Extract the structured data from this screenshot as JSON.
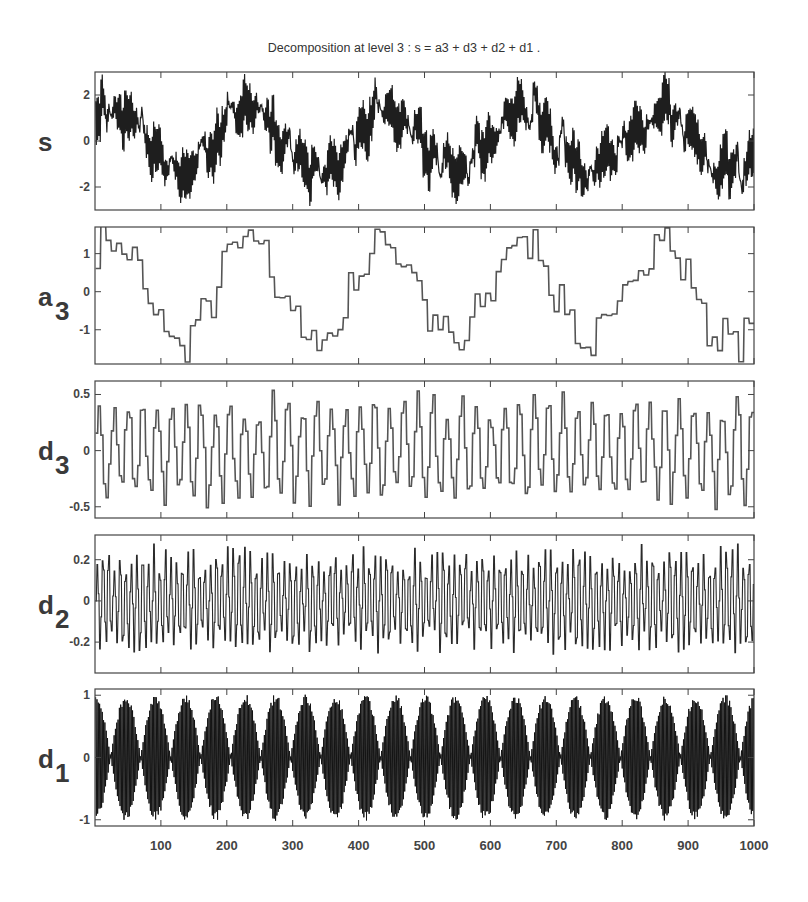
{
  "chart_data": {
    "type": "line",
    "title": "Decomposition at level 3 : s = a3 + d3 + d2 + d1 .",
    "xlabel": "",
    "xlim": [
      0,
      1000
    ],
    "x_ticks": [
      100,
      200,
      300,
      400,
      500,
      600,
      700,
      800,
      900,
      1000
    ],
    "x_tick_labels": [
      "100",
      "200",
      "300",
      "400",
      "500",
      "600",
      "700",
      "800",
      "900",
      "1000"
    ],
    "grid": false,
    "legend": null,
    "panels": [
      {
        "name": "s",
        "ylabel": "s",
        "ylabel_sub": "",
        "ylim": [
          -3,
          3
        ],
        "y_ticks": [
          -2,
          0,
          2
        ],
        "y_tick_labels": [
          "-2",
          "0",
          "2"
        ],
        "description": "Original signal: sum of a slow sinusoid (~period 210, amplitude ~1.3) plus faster oscillations; range approx -2.8 to 2.8",
        "box": {
          "top": 72,
          "bottom": 210
        }
      },
      {
        "name": "a3",
        "ylabel": "a",
        "ylabel_sub": "3",
        "ylim": [
          -1.9,
          1.7
        ],
        "y_ticks": [
          -1,
          0,
          1
        ],
        "y_tick_labels": [
          "-1",
          "0",
          "1"
        ],
        "description": "Level-3 approximation: piecewise-constant (step width 8) slow oscillation, ~5 cycles over 1000 samples, range approx -1.8 to 1.7",
        "box": {
          "top": 227,
          "bottom": 364
        }
      },
      {
        "name": "d3",
        "ylabel": "d",
        "ylabel_sub": "3",
        "ylim": [
          -0.6,
          0.62
        ],
        "y_ticks": [
          -0.5,
          0,
          0.5
        ],
        "y_tick_labels": [
          "-0.5",
          "0",
          "0.5"
        ],
        "description": "Level-3 detail: piecewise-constant oscillation (step width 4), range approx -0.6 to 0.6",
        "box": {
          "top": 381,
          "bottom": 518
        }
      },
      {
        "name": "d2",
        "ylabel": "d",
        "ylabel_sub": "2",
        "ylim": [
          -0.35,
          0.32
        ],
        "y_ticks": [
          -0.2,
          0,
          0.2
        ],
        "y_tick_labels": [
          "-0.2",
          "0",
          "0.2"
        ],
        "description": "Level-2 detail: dense high-frequency oscillation, range approx -0.33 to 0.3",
        "box": {
          "top": 535,
          "bottom": 673
        }
      },
      {
        "name": "d1",
        "ylabel": "d",
        "ylabel_sub": "1",
        "ylim": [
          -1.1,
          1.1
        ],
        "y_ticks": [
          -1,
          0,
          1
        ],
        "y_tick_labels": [
          "-1",
          "0",
          "1"
        ],
        "description": "Level-1 detail: very high-frequency carrier with beating envelope (~22 lobes over 1000 samples), amplitude up to ~1.05",
        "box": {
          "top": 689,
          "bottom": 826
        }
      }
    ]
  }
}
